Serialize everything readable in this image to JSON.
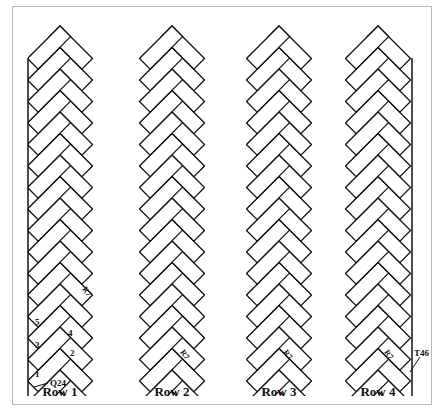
{
  "figure": {
    "type": "herringbone-tile-layout",
    "stroke_color": "#111111",
    "frame_color": "#b8b8b8"
  },
  "rows": [
    {
      "label": "Row 1",
      "center_x": 60,
      "cut": "left"
    },
    {
      "label": "Row 2",
      "center_x": 165,
      "cut": "none"
    },
    {
      "label": "Row 3",
      "center_x": 271,
      "cut": "none"
    },
    {
      "label": "Row 4",
      "center_x": 374,
      "cut": "right"
    }
  ],
  "annotations": {
    "row1_piece_numbers": [
      "1",
      "2",
      "3",
      "4",
      "5"
    ],
    "row1_callout": "Q24",
    "row4_callout": "T46",
    "piece_tag": "R7"
  }
}
